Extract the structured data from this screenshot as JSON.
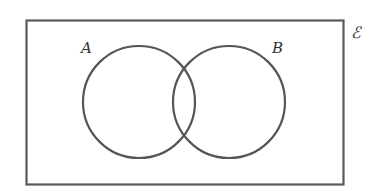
{
  "diagram": {
    "type": "venn",
    "universal_set": {
      "label": "ℰ"
    },
    "sets": [
      {
        "id": "A",
        "label": "A"
      },
      {
        "id": "B",
        "label": "B"
      }
    ],
    "colors": {
      "stroke": "#5a5a5a",
      "background": "#ffffff",
      "text": "#333333"
    }
  }
}
